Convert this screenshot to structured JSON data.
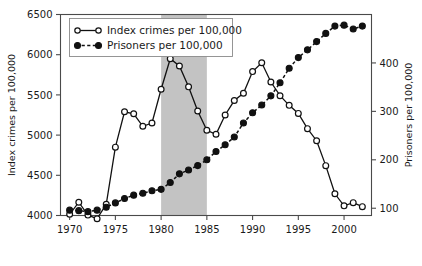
{
  "chart_data": {
    "type": "line",
    "title": "",
    "xlabel": "",
    "ylabel": "Index crimes per 100,000",
    "y2label": "Prisoners per 100,000",
    "xlim": [
      1969,
      2003
    ],
    "ylim": [
      4000,
      6500
    ],
    "y2lim": [
      85,
      500
    ],
    "xticks": [
      1970,
      1975,
      1980,
      1985,
      1990,
      1995,
      2000
    ],
    "yticks": [
      4000,
      4500,
      5000,
      5500,
      6000,
      6500
    ],
    "y2ticks": [
      100,
      200,
      300,
      400
    ],
    "grid": false,
    "legend_position": "top-left",
    "shaded_region": {
      "start": 1980,
      "end": 1985,
      "color": "#c3c3c3"
    },
    "x": [
      1970,
      1971,
      1972,
      1973,
      1974,
      1975,
      1976,
      1977,
      1978,
      1979,
      1980,
      1981,
      1982,
      1983,
      1984,
      1985,
      1986,
      1987,
      1988,
      1989,
      1990,
      1991,
      1992,
      1993,
      1994,
      1995,
      1996,
      1997,
      1998,
      1999,
      2000,
      2001,
      2002
    ],
    "series": [
      {
        "name": "Index crimes per 100,000",
        "axis": "left",
        "marker": "open-circle",
        "linestyle": "solid",
        "color": "#111111",
        "values": [
          4015,
          4165,
          4005,
          3960,
          4140,
          4850,
          5290,
          5265,
          5110,
          5150,
          5570,
          5950,
          5860,
          5600,
          5300,
          5060,
          5010,
          5250,
          5430,
          5520,
          5790,
          5900,
          5660,
          5490,
          5370,
          5270,
          5080,
          4930,
          4620,
          4270,
          4120,
          4160,
          4110
        ]
      },
      {
        "name": "Prisoners per 100,000",
        "axis": "right",
        "marker": "filled-circle",
        "linestyle": "dashed",
        "color": "#111111",
        "values": [
          96,
          95,
          93,
          96,
          102,
          111,
          120,
          127,
          131,
          136,
          139,
          153,
          171,
          179,
          188,
          200,
          217,
          231,
          247,
          276,
          297,
          313,
          332,
          359,
          389,
          411,
          427,
          444,
          461,
          476,
          478,
          470,
          476
        ]
      }
    ]
  },
  "legend": {
    "entries": [
      {
        "label": "Index crimes per 100,000",
        "marker": "open-circle",
        "line": "solid"
      },
      {
        "label": "Prisoners per 100,000",
        "marker": "filled-circle",
        "line": "dashed"
      }
    ]
  },
  "axes": {
    "left_title": "Index crimes per 100,000",
    "right_title": "Prisoners per 100,000",
    "left_ticks": [
      "6500",
      "6000",
      "5500",
      "5000",
      "4500",
      "4000"
    ],
    "right_ticks": [
      "400",
      "300",
      "200",
      "100"
    ],
    "x_ticks": [
      "1970",
      "1975",
      "1980",
      "1985",
      "1990",
      "1995",
      "2000"
    ]
  }
}
